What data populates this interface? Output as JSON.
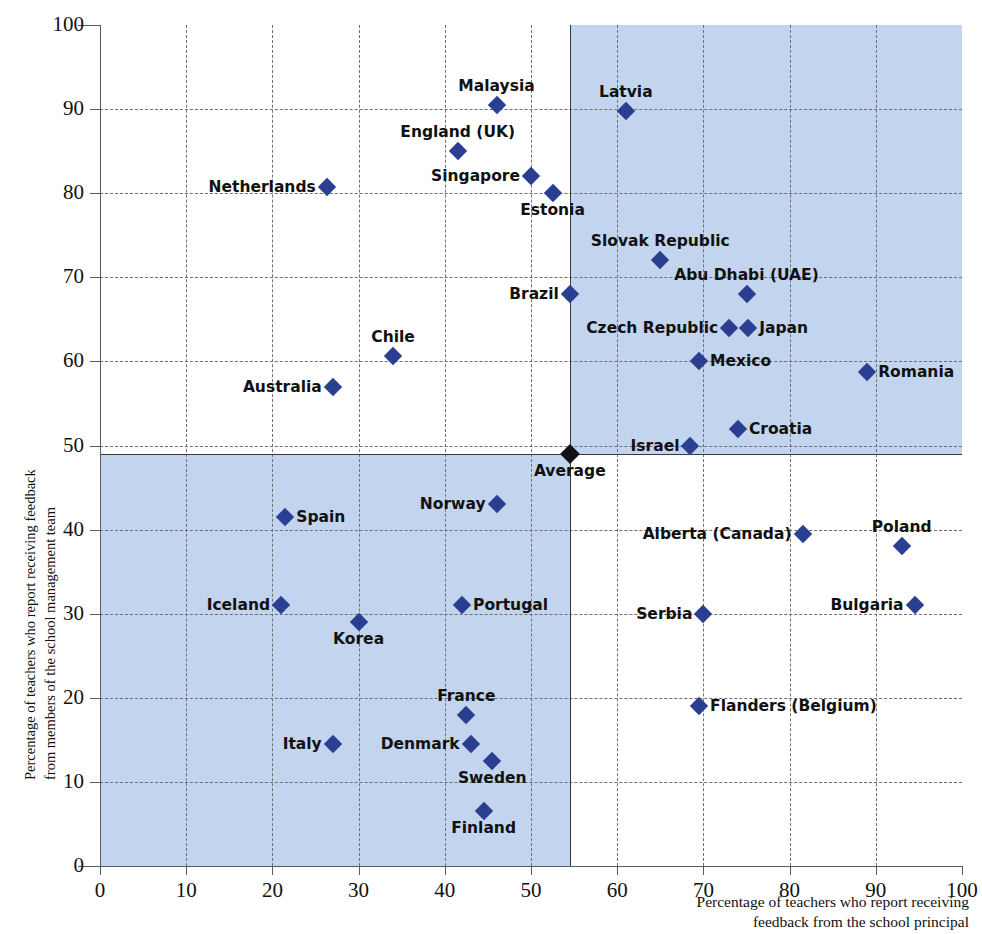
{
  "chart_data": {
    "type": "scatter",
    "title": "",
    "xlabel": "Percentage of teachers who report receiving feedback from the school principal",
    "ylabel": "Percentage of teachers who report receiving feedback from members of the school management team",
    "xlim": [
      0,
      100
    ],
    "ylim": [
      0,
      100
    ],
    "xticks": [
      0,
      10,
      20,
      30,
      40,
      50,
      60,
      70,
      80,
      90,
      100
    ],
    "yticks": [
      0,
      10,
      20,
      30,
      40,
      50,
      60,
      70,
      80,
      90,
      100
    ],
    "grid": true,
    "legend": "none",
    "average_point": {
      "label": "Average",
      "x": 54.5,
      "y": 49
    },
    "reference_lines": {
      "x": 54.5,
      "y": 49
    },
    "shaded_quadrants": [
      "upper-right",
      "lower-left"
    ],
    "marker_color": "#2a3f91",
    "average_marker_color": "#121212",
    "shade_color": "#c3d5ee",
    "points": [
      {
        "label": "Malaysia",
        "x": 46.0,
        "y": 90.5,
        "pos": "t"
      },
      {
        "label": "Latvia",
        "x": 61.0,
        "y": 89.8,
        "pos": "t"
      },
      {
        "label": "England (UK)",
        "x": 41.5,
        "y": 85.0,
        "pos": "t"
      },
      {
        "label": "Singapore",
        "x": 50.0,
        "y": 82.0,
        "pos": "l"
      },
      {
        "label": "Netherlands",
        "x": 26.3,
        "y": 80.7,
        "pos": "l"
      },
      {
        "label": "Estonia",
        "x": 52.5,
        "y": 80.0,
        "pos": "b"
      },
      {
        "label": "Slovak Republic",
        "x": 65.0,
        "y": 72.0,
        "pos": "t"
      },
      {
        "label": "Abu Dhabi (UAE)",
        "x": 75.0,
        "y": 68.0,
        "pos": "t"
      },
      {
        "label": "Brazil",
        "x": 54.5,
        "y": 68.0,
        "pos": "l"
      },
      {
        "label": "Czech Republic",
        "x": 73.0,
        "y": 64.0,
        "pos": "l"
      },
      {
        "label": "Japan",
        "x": 75.2,
        "y": 64.0,
        "pos": "r"
      },
      {
        "label": "Chile",
        "x": 34.0,
        "y": 60.7,
        "pos": "t"
      },
      {
        "label": "Mexico",
        "x": 69.5,
        "y": 60.0,
        "pos": "r"
      },
      {
        "label": "Romania",
        "x": 89.0,
        "y": 58.7,
        "pos": "r"
      },
      {
        "label": "Australia",
        "x": 27.0,
        "y": 57.0,
        "pos": "l"
      },
      {
        "label": "Croatia",
        "x": 74.0,
        "y": 52.0,
        "pos": "r"
      },
      {
        "label": "Israel",
        "x": 68.5,
        "y": 50.0,
        "pos": "l"
      },
      {
        "label": "Norway",
        "x": 46.0,
        "y": 43.0,
        "pos": "l"
      },
      {
        "label": "Spain",
        "x": 21.5,
        "y": 41.5,
        "pos": "r"
      },
      {
        "label": "Alberta (Canada)",
        "x": 81.5,
        "y": 39.5,
        "pos": "l"
      },
      {
        "label": "Poland",
        "x": 93.0,
        "y": 38.0,
        "pos": "t"
      },
      {
        "label": "Iceland",
        "x": 21.0,
        "y": 31.0,
        "pos": "l"
      },
      {
        "label": "Portugal",
        "x": 42.0,
        "y": 31.0,
        "pos": "r"
      },
      {
        "label": "Bulgaria",
        "x": 94.5,
        "y": 31.0,
        "pos": "l"
      },
      {
        "label": "Serbia",
        "x": 70.0,
        "y": 30.0,
        "pos": "l"
      },
      {
        "label": "Korea",
        "x": 30.0,
        "y": 29.0,
        "pos": "b"
      },
      {
        "label": "Flanders (Belgium)",
        "x": 69.5,
        "y": 19.0,
        "pos": "r"
      },
      {
        "label": "France",
        "x": 42.5,
        "y": 18.0,
        "pos": "t"
      },
      {
        "label": "Italy",
        "x": 27.0,
        "y": 14.5,
        "pos": "l"
      },
      {
        "label": "Denmark",
        "x": 43.0,
        "y": 14.5,
        "pos": "l"
      },
      {
        "label": "Sweden",
        "x": 45.5,
        "y": 12.5,
        "pos": "b"
      },
      {
        "label": "Finland",
        "x": 44.5,
        "y": 6.5,
        "pos": "b"
      }
    ]
  },
  "axes": {
    "y_title_line1": "Percentage of teachers who report receiving feedback",
    "y_title_line2": "from members of the school management team",
    "x_title_line1": "Percentage of teachers who report receiving",
    "x_title_line2": "feedback from the school principal"
  }
}
